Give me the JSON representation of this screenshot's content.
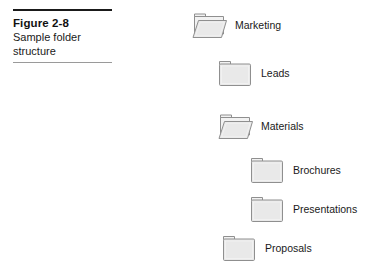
{
  "figure": {
    "number_label": "Figure 2-8",
    "caption_line_1": "Sample folder",
    "caption_line_2": "structure",
    "rule_color_top": "#1a1a1a",
    "rule_color_bottom": "#9a9a9a"
  },
  "colors": {
    "page_background": "#ffffff",
    "folder_fill": "#e9e9e9",
    "folder_fill_light": "#f2f2f2",
    "folder_outline": "#8f8f8f",
    "text": "#1a1a1a"
  },
  "tree": {
    "items": [
      {
        "label": "Marketing",
        "icon": "folder-open-icon",
        "state": "open",
        "level": 0,
        "x": 192,
        "y": 9
      },
      {
        "label": "Leads",
        "icon": "folder-closed-icon",
        "state": "closed",
        "level": 1,
        "x": 218,
        "y": 57
      },
      {
        "label": "Materials",
        "icon": "folder-open-icon",
        "state": "open",
        "level": 1,
        "x": 218,
        "y": 110
      },
      {
        "label": "Brochures",
        "icon": "folder-closed-icon",
        "state": "closed",
        "level": 2,
        "x": 250,
        "y": 154
      },
      {
        "label": "Presentations",
        "icon": "folder-closed-icon",
        "state": "closed",
        "level": 2,
        "x": 250,
        "y": 193
      },
      {
        "label": "Proposals",
        "icon": "folder-closed-icon",
        "state": "closed",
        "level": 1,
        "x": 222,
        "y": 232
      }
    ]
  }
}
